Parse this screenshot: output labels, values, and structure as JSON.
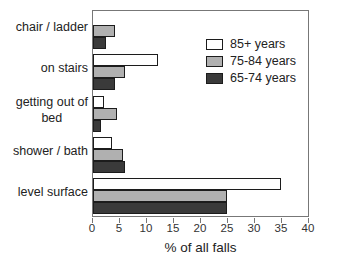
{
  "chart_data": {
    "type": "bar",
    "orientation": "horizontal",
    "title": "",
    "xlabel": "% of all falls",
    "ylabel": "",
    "xlim": [
      0,
      40
    ],
    "xticks": [
      0,
      5,
      10,
      15,
      20,
      25,
      30,
      35,
      40
    ],
    "grid": false,
    "legend_position": "top-right-inside",
    "categories": [
      "chair / ladder",
      "on stairs",
      "getting out of\nbed",
      "shower / bath",
      "level surface"
    ],
    "series": [
      {
        "name": "85+ years",
        "color": "#ffffff",
        "values": [
          0,
          12,
          2,
          3.5,
          35
        ]
      },
      {
        "name": "75-84 years",
        "color": "#b0b0b0",
        "values": [
          4,
          6,
          4.5,
          5.5,
          25
        ]
      },
      {
        "name": "65-74 years",
        "color": "#3a3a3a",
        "values": [
          2.5,
          4,
          1.5,
          6,
          25
        ]
      }
    ]
  },
  "colors": {
    "background": "#ffffff",
    "plot_border": "#777777",
    "bar_outline": "#1c1c1c",
    "text": "#222222"
  }
}
